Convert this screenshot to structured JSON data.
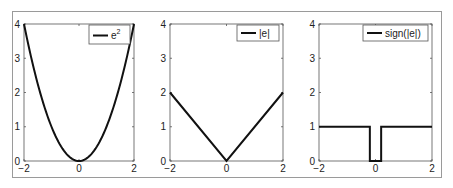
{
  "chart_data": [
    {
      "type": "line",
      "title": "",
      "legend": [
        "e^2"
      ],
      "legend_label_base": "e",
      "legend_label_sup": "2",
      "legend_position": "upper right",
      "xlabel": "",
      "ylabel": "",
      "xlim": [
        -2,
        2
      ],
      "ylim": [
        0,
        4
      ],
      "xticks": [
        "-2",
        "0",
        "2"
      ],
      "yticks": [
        "0",
        "1",
        "2",
        "3",
        "4"
      ],
      "grid": false,
      "series": [
        {
          "name": "e^2",
          "x": [
            -2,
            -1.5,
            -1,
            -0.5,
            0,
            0.5,
            1,
            1.5,
            2
          ],
          "y": [
            4,
            2.25,
            1,
            0.25,
            0,
            0.25,
            1,
            2.25,
            4
          ]
        }
      ]
    },
    {
      "type": "line",
      "title": "",
      "legend": [
        "|e|"
      ],
      "legend_position": "upper right",
      "xlabel": "",
      "ylabel": "",
      "xlim": [
        -2,
        2
      ],
      "ylim": [
        0,
        4
      ],
      "xticks": [
        "-2",
        "0",
        "2"
      ],
      "yticks": [
        "0",
        "1",
        "2",
        "3",
        "4"
      ],
      "grid": false,
      "series": [
        {
          "name": "|e|",
          "x": [
            -2,
            0,
            2
          ],
          "y": [
            2,
            0,
            2
          ]
        }
      ]
    },
    {
      "type": "line",
      "title": "",
      "legend": [
        "sign(|e|)"
      ],
      "legend_position": "upper right",
      "xlabel": "",
      "ylabel": "",
      "xlim": [
        -2,
        2
      ],
      "ylim": [
        0,
        4
      ],
      "xticks": [
        "-2",
        "0",
        "2"
      ],
      "yticks": [
        "0",
        "1",
        "2",
        "3",
        "4"
      ],
      "grid": false,
      "series": [
        {
          "name": "sign(|e|)",
          "x": [
            -2,
            -0.2,
            -0.2,
            0.2,
            0.2,
            2
          ],
          "y": [
            1,
            1,
            0,
            0,
            1,
            1
          ]
        }
      ]
    }
  ],
  "style": {
    "line_color": "#111111",
    "axis_color": "#555555",
    "frame_color": "#9a9a9a"
  }
}
